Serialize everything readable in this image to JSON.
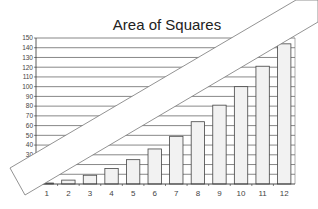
{
  "chart_data": {
    "type": "bar",
    "title": "Area of Squares",
    "xlabel": "",
    "ylabel": "",
    "categories": [
      "1",
      "2",
      "3",
      "4",
      "5",
      "6",
      "7",
      "8",
      "9",
      "10",
      "11",
      "12"
    ],
    "values": [
      1,
      4,
      9,
      16,
      25,
      36,
      49,
      64,
      81,
      100,
      121,
      144
    ],
    "ylim": [
      0,
      150
    ],
    "yticks": [
      30,
      40,
      50,
      60,
      70,
      80,
      90,
      100,
      110,
      120,
      130,
      140,
      150
    ],
    "grid": true,
    "legend": "none",
    "bar_fill": "#f2f2f2",
    "bar_stroke": "#444444",
    "gridline_color": "#555555",
    "overlay": "white diagonal band obscuring part of chart"
  }
}
